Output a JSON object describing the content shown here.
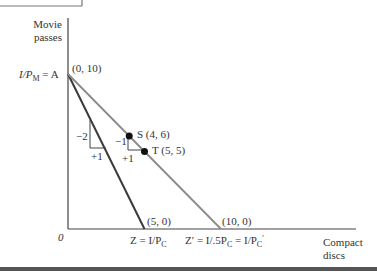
{
  "axes": {
    "y_label_line1": "Movie",
    "y_label_line2": "passes",
    "x_label_line1": "Compact",
    "x_label_line2": "discs",
    "origin": "0"
  },
  "labels": {
    "y_intercept": "I/P",
    "y_intercept_sub": "M",
    "y_intercept_suffix": " = A",
    "point_a": "(0, 10)",
    "z_point": "(5, 0)",
    "z_prime_point": "(10, 0)",
    "z_label": "Z = I/P",
    "z_label_sub": "C",
    "z_prime_label": "Z′ = I/.5P",
    "z_prime_label_sub": "C",
    "z_prime_label_mid": " = I/P",
    "z_prime_label_sub2": "C",
    "z_prime_label_prime": "′",
    "s_label": "S (4, 6)",
    "t_label": "T (5, 5)",
    "dark_rise": "−2",
    "dark_run": "+1",
    "grey_rise": "−1",
    "grey_run": "+1"
  },
  "diagram": {
    "x_range": [
      0,
      10
    ],
    "y_range": [
      0,
      10
    ],
    "lines": [
      {
        "name": "budget-line-original",
        "from": [
          0,
          10
        ],
        "to": [
          5,
          0
        ],
        "color": "#3a3a3a"
      },
      {
        "name": "budget-line-new",
        "from": [
          0,
          10
        ],
        "to": [
          10,
          0
        ],
        "color": "#8a8a8a"
      }
    ],
    "points": [
      {
        "name": "S",
        "x": 4,
        "y": 6
      },
      {
        "name": "T",
        "x": 5,
        "y": 5
      }
    ]
  }
}
